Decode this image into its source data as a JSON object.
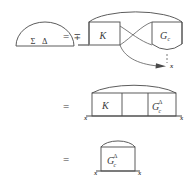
{
  "figure": {
    "type": "diagram",
    "rows": [
      {
        "id": "row-1",
        "lhs": {
          "shape": "dome",
          "label_sigma": "Σ",
          "label_delta": "Δ"
        },
        "equals": "=",
        "sign": "∓",
        "boxes": [
          {
            "label_main": "K",
            "sub": "",
            "sup": ""
          },
          {
            "label_main": "G",
            "sub": "c",
            "sup": ""
          }
        ],
        "annotation": {
          "arrow_label": "x",
          "arrow_style": "dashed-with-arrowhead"
        }
      },
      {
        "id": "row-2",
        "equals": "=",
        "boxes": [
          {
            "label_main": "K",
            "sub": "",
            "sup": ""
          },
          {
            "label_main": "",
            "sub": "",
            "sup": ""
          },
          {
            "label_main": "G",
            "sub": "c",
            "sup": "Δ"
          }
        ],
        "endpoints": {
          "left": "x",
          "right": "x"
        }
      },
      {
        "id": "row-3",
        "equals": "=",
        "boxes": [
          {
            "label_main": "G",
            "sub": "c",
            "sup": "Δ"
          }
        ],
        "endpoints": {
          "left": "x",
          "right": "x"
        }
      }
    ]
  }
}
